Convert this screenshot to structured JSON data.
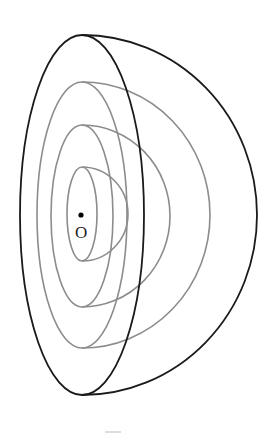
{
  "figure": {
    "type": "hemisphere-with-concentric-shells",
    "center_label": "O",
    "colors": {
      "outer_shell": "#1a1a1a",
      "inner_shells": "#8c8c8c",
      "center_point": "#000000",
      "bottom_mark": "#c8c8c8"
    },
    "shells": [
      {
        "name": "outer",
        "front_rx": 62,
        "ry": 180,
        "back_rx": 175
      },
      {
        "name": "shell-1",
        "front_rx": 45,
        "ry": 133,
        "back_rx": 128
      },
      {
        "name": "shell-2",
        "front_rx": 31,
        "ry": 91,
        "back_rx": 88
      },
      {
        "name": "shell-3",
        "front_rx": 15,
        "ry": 47,
        "back_rx": 46
      }
    ]
  }
}
